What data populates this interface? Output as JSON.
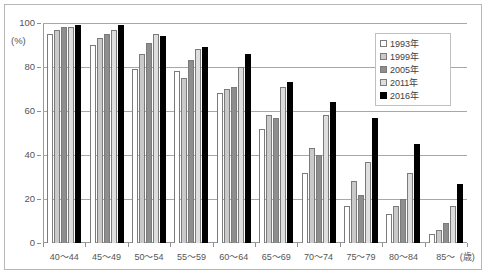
{
  "chart_data": {
    "type": "bar",
    "title": "",
    "subtitle": "",
    "xlabel": "(歳)",
    "ylabel": "(%)",
    "ylim": [
      0,
      100
    ],
    "yticks": [
      0,
      20,
      40,
      60,
      80,
      100
    ],
    "grid": true,
    "legend_position": "top-right",
    "categories": [
      "40〜44",
      "45〜49",
      "50〜54",
      "55〜59",
      "60〜64",
      "65〜69",
      "70〜74",
      "75〜79",
      "80〜84",
      "85〜"
    ],
    "series": [
      {
        "name": "1993年",
        "color": "#ffffff",
        "values": [
          95,
          90,
          79,
          78,
          68,
          52,
          32,
          17,
          13,
          4
        ]
      },
      {
        "name": "1999年",
        "color": "#c9c9c9",
        "values": [
          97,
          93,
          86,
          75,
          70,
          58,
          43,
          28,
          17,
          6
        ]
      },
      {
        "name": "2005年",
        "color": "#8e8e8e",
        "values": [
          98,
          95,
          91,
          83,
          71,
          57,
          40,
          22,
          20,
          9
        ]
      },
      {
        "name": "2011年",
        "color": "#dedede",
        "values": [
          98,
          97,
          95,
          88,
          80,
          71,
          58,
          37,
          32,
          17
        ]
      },
      {
        "name": "2016年",
        "color": "#000000",
        "values": [
          99,
          99,
          94,
          89,
          86,
          73,
          64,
          57,
          45,
          27
        ]
      }
    ]
  },
  "legend": {
    "items": [
      {
        "label": "1993年"
      },
      {
        "label": "1999年"
      },
      {
        "label": "2005年"
      },
      {
        "label": "2011年"
      },
      {
        "label": "2016年"
      }
    ]
  },
  "axes": {
    "y_unit": "(%)",
    "x_unit": "(歳)",
    "y_ticks": [
      "0",
      "20",
      "40",
      "60",
      "80",
      "100"
    ]
  }
}
